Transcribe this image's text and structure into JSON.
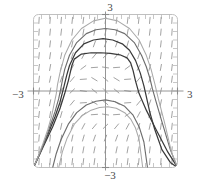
{
  "figure": {
    "title": "",
    "kind": "slope-field-with-solution-curves"
  },
  "labels": {
    "top": "3",
    "bottom": "−3",
    "left": "−3",
    "right": "3"
  },
  "colors": {
    "frame": "#b9b9b9",
    "axis": "#8a8a8a",
    "slope_dash": "#8d8d8d",
    "curve_dark": "#3a3a3a",
    "curve_mid": "#6e6e6e",
    "curve_light": "#a9a9a9",
    "background": "#ffffff"
  },
  "chart_data": {
    "type": "line",
    "title": "",
    "xlabel": "",
    "ylabel": "",
    "xlim": [
      -3,
      3
    ],
    "ylim": [
      -3,
      3
    ],
    "grid": false,
    "axes_shown": [
      "x-axis at y=0",
      "y-axis at x=0"
    ],
    "tick_labels": {
      "x": [
        "−3",
        "3"
      ],
      "y": [
        "−3",
        "3"
      ]
    },
    "tick_count_per_edge": 18,
    "slope_field": {
      "description": "Short dashed line segments on a grid showing direction of y' over the square [-3,3] x [-3,3]. Segments are steep (near vertical, positive slope) far from the x-axis and flatten to nearly horizontal near y = 0.",
      "nx": 13,
      "ny": 13,
      "dash_length": 7,
      "slope_rule": "dy/dx = x^2 + y^2 - 1"
    },
    "series": [
      {
        "name": "solution-curve-1",
        "shade": "curve_dark",
        "x": [
          -3.0,
          -2.6,
          -2.2,
          -1.9,
          -1.7,
          -1.55,
          -1.45,
          -1.4,
          -1.3,
          -1.0,
          -0.6,
          -0.2,
          0.2,
          0.6,
          0.9,
          1.05,
          1.15,
          1.25,
          1.4,
          1.7,
          2.1,
          2.6,
          3.0
        ],
        "y": [
          -3.0,
          -2.2,
          -1.4,
          -0.7,
          -0.1,
          0.4,
          0.8,
          1.0,
          1.25,
          1.45,
          1.5,
          1.5,
          1.48,
          1.42,
          1.3,
          1.1,
          0.8,
          0.4,
          -0.1,
          -0.75,
          -1.5,
          -2.4,
          -3.0
        ]
      },
      {
        "name": "solution-curve-2",
        "shade": "curve_dark",
        "x": [
          -3.0,
          -2.7,
          -2.4,
          -2.1,
          -1.9,
          -1.75,
          -1.62,
          -1.5,
          -1.25,
          -0.9,
          -0.5,
          -0.1,
          0.3,
          0.7,
          1.0,
          1.25,
          1.45,
          1.6,
          1.72,
          1.85,
          2.05,
          2.35,
          2.7,
          3.0
        ],
        "y": [
          -3.0,
          -2.35,
          -1.7,
          -1.0,
          -0.45,
          0.1,
          0.6,
          1.0,
          1.5,
          1.85,
          2.0,
          2.05,
          2.0,
          1.85,
          1.6,
          1.2,
          0.7,
          0.2,
          -0.3,
          -0.85,
          -1.5,
          -2.3,
          -2.8,
          -3.0
        ]
      },
      {
        "name": "solution-curve-3",
        "shade": "curve_mid",
        "x": [
          -3.0,
          -2.75,
          -2.5,
          -2.3,
          -2.1,
          -1.95,
          -1.85,
          -1.78,
          -1.7,
          -1.5,
          -1.2,
          -0.8,
          -0.4,
          0.0,
          0.4,
          0.8,
          1.2,
          1.5,
          1.7,
          1.85,
          1.95,
          2.1,
          2.35,
          2.7,
          3.0
        ],
        "y": [
          -3.0,
          -2.5,
          -1.9,
          -1.35,
          -0.8,
          -0.3,
          0.15,
          0.5,
          0.85,
          1.4,
          1.9,
          2.25,
          2.4,
          2.45,
          2.4,
          2.25,
          1.9,
          1.4,
          0.95,
          0.5,
          0.1,
          -0.4,
          -1.2,
          -2.3,
          -3.0
        ]
      },
      {
        "name": "solution-curve-4",
        "shade": "curve_light",
        "x": [
          -3.0,
          -2.8,
          -2.6,
          -2.4,
          -2.25,
          -2.15,
          -2.05,
          -2.0,
          -1.9,
          -1.7,
          -1.4,
          -1.0,
          -0.5,
          0.0,
          0.5,
          1.0,
          1.4,
          1.7,
          1.9,
          2.05,
          2.2,
          2.45,
          2.75,
          3.0
        ],
        "y": [
          -3.0,
          -2.55,
          -2.05,
          -1.5,
          -1.0,
          -0.55,
          -0.1,
          0.25,
          0.7,
          1.4,
          2.0,
          2.45,
          2.75,
          2.85,
          2.75,
          2.45,
          2.0,
          1.4,
          0.85,
          0.3,
          -0.3,
          -1.2,
          -2.4,
          -3.0
        ]
      },
      {
        "name": "solution-curve-5",
        "shade": "curve_light",
        "x": [
          -1.95,
          -1.8,
          -1.6,
          -1.3,
          -0.95,
          -0.6,
          -0.25,
          0.1,
          0.45,
          0.8,
          1.05,
          1.25,
          1.4,
          1.55
        ],
        "y": [
          -3.0,
          -2.4,
          -1.85,
          -1.3,
          -0.95,
          -0.75,
          -0.65,
          -0.62,
          -0.68,
          -0.85,
          -1.1,
          -1.45,
          -1.9,
          -3.0
        ]
      },
      {
        "name": "solution-curve-6",
        "shade": "curve_mid",
        "x": [
          -2.2,
          -2.05,
          -1.85,
          -1.55,
          -1.2,
          -0.8,
          -0.4,
          0.0,
          0.4,
          0.8,
          1.15,
          1.4,
          1.6,
          1.75
        ],
        "y": [
          -3.0,
          -2.45,
          -1.9,
          -1.3,
          -0.85,
          -0.55,
          -0.4,
          -0.35,
          -0.42,
          -0.6,
          -0.95,
          -1.4,
          -2.0,
          -3.0
        ]
      }
    ]
  }
}
